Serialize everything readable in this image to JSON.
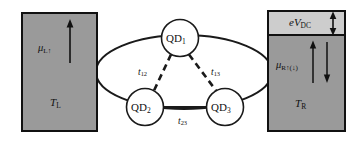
{
  "figure": {
    "name": "triple-quantum-dot-transport-schematic",
    "background": "#ffffff",
    "width": 358,
    "height": 141
  },
  "colors": {
    "lead_fill": "#9a9a9a",
    "bias_band_fill": "#cdcdcd",
    "outline": "#111111",
    "dot_fill": "#ffffff",
    "line": "#1a1a1a"
  },
  "left_lead": {
    "name": "left-lead",
    "chemical_potential": "μ",
    "chemical_potential_sub": "L↑",
    "temperature": "T",
    "temperature_sub": "L",
    "arrow_direction": "up"
  },
  "right_lead": {
    "name": "right-lead",
    "bias_label": "eV",
    "bias_label_sub": "DC",
    "chemical_potential": "μ",
    "chemical_potential_sub": "R↑(↓)",
    "temperature": "T",
    "temperature_sub": "R",
    "bias_arrow_direction": "double-vertical",
    "inner_arrow_left_direction": "up",
    "inner_arrow_right_direction": "down"
  },
  "dots": [
    {
      "id": "qd1",
      "label": "QD",
      "sub": "1",
      "cx": 180,
      "cy": 38,
      "r": 18.5
    },
    {
      "id": "qd2",
      "label": "QD",
      "sub": "2",
      "cx": 145,
      "cy": 107,
      "r": 18.5
    },
    {
      "id": "qd3",
      "label": "QD",
      "sub": "3",
      "cx": 225,
      "cy": 107,
      "r": 18.5
    }
  ],
  "couplings": [
    {
      "id": "t12",
      "label": "t",
      "sub": "12",
      "between": "QD1-QD2",
      "style": "dashed"
    },
    {
      "id": "t13",
      "label": "t",
      "sub": "13",
      "between": "QD1-QD3",
      "style": "dashed"
    },
    {
      "id": "t23",
      "label": "t",
      "sub": "23",
      "between": "QD2-QD3",
      "style": "solid"
    }
  ],
  "loop": {
    "name": "ring-contour",
    "description": "ellipse linking the three quantum dots to both leads"
  }
}
